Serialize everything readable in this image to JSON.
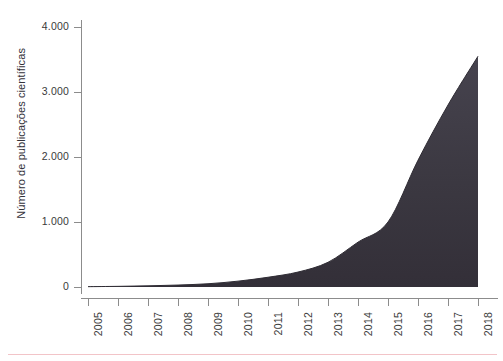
{
  "chart_data": {
    "type": "area",
    "title": "",
    "subtitle": "",
    "xlabel": "",
    "ylabel": "Número de publicações científicas",
    "x": [
      2005,
      2006,
      2007,
      2008,
      2009,
      2010,
      2011,
      2012,
      2013,
      2014,
      2015,
      2016,
      2017,
      2018
    ],
    "categories": [
      "2005",
      "2006",
      "2007",
      "2008",
      "2009",
      "2010",
      "2011",
      "2012",
      "2013",
      "2014",
      "2015",
      "2016",
      "2017",
      "2018"
    ],
    "values": [
      5,
      10,
      18,
      30,
      50,
      90,
      150,
      230,
      380,
      690,
      1000,
      1950,
      2800,
      3550
    ],
    "series": [
      {
        "name": "Número de publicações científicas",
        "values": [
          5,
          10,
          18,
          30,
          50,
          90,
          150,
          230,
          380,
          690,
          1000,
          1950,
          2800,
          3550
        ]
      }
    ],
    "xlim": [
      2005,
      2018
    ],
    "ylim": [
      0,
      4000
    ],
    "ytick_labels": [
      "0",
      "1.000",
      "2.000",
      "3.000",
      "4.000"
    ],
    "ytick_values": [
      0,
      1000,
      2000,
      3000,
      4000
    ],
    "xtick_labels": [
      "2005",
      "2006",
      "2007",
      "2008",
      "2009",
      "2010",
      "2011",
      "2012",
      "2013",
      "2014",
      "2015",
      "2016",
      "2017",
      "2018"
    ],
    "grid": false,
    "legend": false,
    "legend_position": "none",
    "xtick_label_rotation": 90,
    "fill_color": "#3b3841",
    "line_color": "#2f2c34",
    "axis_color": "#8c8c8c",
    "tick_label_color": "#3a3a3a",
    "axis_title_color": "#33323a",
    "background_color": "#ffffff",
    "footer_rule_color": "#f2c4c8"
  }
}
